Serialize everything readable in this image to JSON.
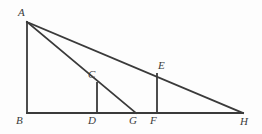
{
  "figure": {
    "background_color": "#fdfdfd",
    "stroke_color": "#3a3a3a",
    "label_color": "#3b3b3b",
    "stroke_width": 1.8,
    "width": 262,
    "height": 134
  },
  "points": [
    {
      "id": "A",
      "label": "A",
      "x": 27,
      "y": 22,
      "label_x": 18,
      "label_y": 7,
      "role": "apex-top-left"
    },
    {
      "id": "B",
      "label": "B",
      "x": 27,
      "y": 113,
      "label_x": 16,
      "label_y": 115,
      "role": "right-angle-corner"
    },
    {
      "id": "C",
      "label": "C",
      "x": 97,
      "y": 83,
      "label_x": 88,
      "label_y": 69,
      "role": "on-segment-AG"
    },
    {
      "id": "D",
      "label": "D",
      "x": 97,
      "y": 113,
      "label_x": 88,
      "label_y": 115,
      "role": "foot-of-C"
    },
    {
      "id": "E",
      "label": "E",
      "x": 157,
      "y": 74,
      "label_x": 158,
      "label_y": 60,
      "role": "on-segment-AH"
    },
    {
      "id": "F",
      "label": "F",
      "x": 157,
      "y": 113,
      "label_x": 150,
      "label_y": 115,
      "role": "foot-of-E"
    },
    {
      "id": "G",
      "label": "G",
      "x": 136,
      "y": 113,
      "label_x": 129,
      "label_y": 115,
      "role": "foot-of-cevian-AG"
    },
    {
      "id": "H",
      "label": "H",
      "x": 243,
      "y": 113,
      "label_x": 240,
      "label_y": 116,
      "role": "apex-bottom-right"
    }
  ],
  "segments": [
    {
      "id": "AB",
      "name": "segment-ab",
      "from": "A",
      "to": "B",
      "x1": 27,
      "y1": 22,
      "x2": 27,
      "y2": 113
    },
    {
      "id": "BH",
      "name": "segment-bh",
      "from": "B",
      "to": "H",
      "x1": 27,
      "y1": 113,
      "x2": 243,
      "y2": 113
    },
    {
      "id": "AH",
      "name": "segment-ah",
      "from": "A",
      "to": "H",
      "x1": 27,
      "y1": 22,
      "x2": 243,
      "y2": 113
    },
    {
      "id": "AG",
      "name": "segment-ag",
      "from": "A",
      "to": "G",
      "x1": 27,
      "y1": 22,
      "x2": 136,
      "y2": 113
    },
    {
      "id": "CD",
      "name": "segment-cd",
      "from": "C",
      "to": "D",
      "x1": 97,
      "y1": 83,
      "x2": 97,
      "y2": 113
    },
    {
      "id": "EF",
      "name": "segment-ef",
      "from": "E",
      "to": "F",
      "x1": 157,
      "y1": 74,
      "x2": 157,
      "y2": 113
    }
  ]
}
